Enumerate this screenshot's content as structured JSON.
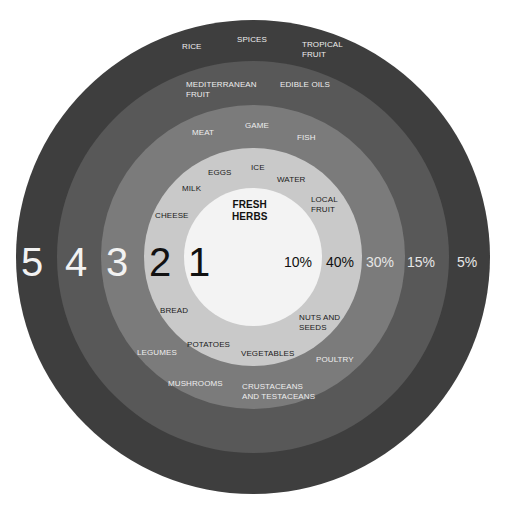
{
  "diagram": {
    "center": {
      "x": 253,
      "y": 257
    },
    "rings": [
      {
        "level": "5",
        "percent": "5%",
        "radius": 237,
        "color": "#3e3e3e",
        "items": [
          "RICE",
          "SPICES",
          "TROPICAL\nFRUIT"
        ]
      },
      {
        "level": "4",
        "percent": "15%",
        "radius": 196,
        "color": "#585858",
        "items": [
          "MEDITERRANEAN\nFRUIT",
          "EDIBLE OILS",
          "MUSHROOMS",
          "CRUSTACEANS\nAND TESTACEANS"
        ]
      },
      {
        "level": "3",
        "percent": "30%",
        "radius": 152,
        "color": "#7b7b7b",
        "items": [
          "MEAT",
          "GAME",
          "FISH",
          "LEGUMES",
          "POULTRY"
        ]
      },
      {
        "level": "2",
        "percent": "40%",
        "radius": 109,
        "color": "#c9c9c9",
        "items": [
          "EGGS",
          "ICE",
          "WATER",
          "MILK",
          "LOCAL\nFRUIT",
          "CHEESE",
          "BREAD",
          "NUTS AND\nSEEDS",
          "POTATOES",
          "VEGETABLES"
        ]
      },
      {
        "level": "1",
        "percent": "10%",
        "radius": 69,
        "color": "#f3f3f3",
        "items": [
          "FRESH\nHERBS"
        ]
      }
    ]
  },
  "labels": {
    "ring5": {
      "rice": "RICE",
      "spices": "SPICES",
      "tropical_fruit": "TROPICAL\nFRUIT"
    },
    "ring4": {
      "mediterranean_fruit": "MEDITERRANEAN\nFRUIT",
      "edible_oils": "EDIBLE OILS",
      "mushrooms": "MUSHROOMS",
      "crustaceans": "CRUSTACEANS\nAND TESTACEANS"
    },
    "ring3": {
      "meat": "MEAT",
      "game": "GAME",
      "fish": "FISH",
      "legumes": "LEGUMES",
      "poultry": "POULTRY"
    },
    "ring2": {
      "eggs": "EGGS",
      "ice": "ICE",
      "water": "WATER",
      "milk": "MILK",
      "local_fruit": "LOCAL\nFRUIT",
      "cheese": "CHEESE",
      "bread": "BREAD",
      "nuts_seeds": "NUTS AND\nSEEDS",
      "potatoes": "POTATOES",
      "vegetables": "VEGETABLES"
    },
    "ring1": {
      "fresh_herbs": "FRESH\nHERBS"
    }
  },
  "levels": {
    "l5": "5",
    "l4": "4",
    "l3": "3",
    "l2": "2",
    "l1": "1"
  },
  "percents": {
    "p1": "10%",
    "p2": "40%",
    "p3": "30%",
    "p4": "15%",
    "p5": "5%"
  },
  "colors": {
    "ring5": "#3e3e3e",
    "ring4": "#585858",
    "ring3": "#7b7b7b",
    "ring2": "#c9c9c9",
    "ring1": "#f3f3f3",
    "text_light": "#eeeeee",
    "text_dark": "#1a1a1a"
  }
}
